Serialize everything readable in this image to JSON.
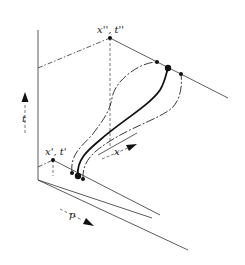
{
  "diagram": {
    "labels": {
      "end_point": "x'', t''",
      "start_point": "x', t'",
      "time_axis": "t",
      "position_axis": "x",
      "momentum_axis": "p"
    },
    "colors": {
      "line": "#333333",
      "path": "#111111",
      "background": "#ffffff"
    },
    "paths": [
      {
        "name": "classical-path",
        "style": "solid-thick"
      },
      {
        "name": "varied-path-left",
        "style": "dash-dot"
      },
      {
        "name": "varied-path-right",
        "style": "dash-dot"
      }
    ]
  }
}
